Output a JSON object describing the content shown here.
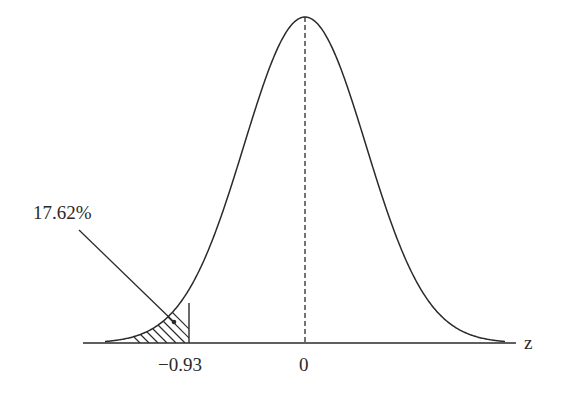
{
  "figure": {
    "type": "normal-distribution-curve",
    "axis_label": "z",
    "ticks": [
      {
        "value": -0.93,
        "label": "−0.93"
      },
      {
        "value": 0,
        "label": "0"
      }
    ],
    "shaded_region": {
      "from": "-inf",
      "to": -0.93,
      "pattern": "hatched"
    },
    "annotation": {
      "text": "17.62%",
      "points_to": "shaded-region"
    },
    "center_line": "dashed"
  },
  "colors": {
    "line": "#2a2a2a",
    "background": "#ffffff"
  }
}
